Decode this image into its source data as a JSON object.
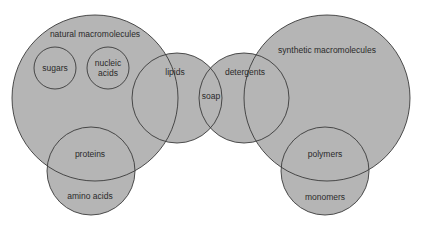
{
  "diagram": {
    "type": "venn",
    "colors": {
      "background": "#ffffff",
      "fill": "#b5b5b5",
      "stroke": "#3a3a3a",
      "text": "#2a2a2a"
    },
    "sets": {
      "natural_macromolecules": {
        "label": "natural macromolecules",
        "cx": 95,
        "cy": 98,
        "r": 83
      },
      "sugars": {
        "label": "sugars",
        "cx": 55,
        "cy": 68,
        "r": 21
      },
      "nucleic_acids": {
        "label_line1": "nucleic",
        "label_line2": "acids",
        "cx": 108,
        "cy": 68,
        "r": 21
      },
      "lipids": {
        "label": "lipids",
        "cx": 177,
        "cy": 98,
        "r": 45
      },
      "soap": {
        "label": "soap"
      },
      "detergents": {
        "label": "detergents",
        "cx": 244,
        "cy": 98,
        "r": 45
      },
      "synthetic_macromolecules": {
        "label": "synthetic macromolecules",
        "cx": 327,
        "cy": 98,
        "r": 83
      },
      "proteins_amino": {
        "upper_label": "proteins",
        "lower_label": "amino acids",
        "cx": 91,
        "cy": 171,
        "r": 44
      },
      "polymers_monomers": {
        "upper_label": "polymers",
        "lower_label": "monomers",
        "cx": 325,
        "cy": 171,
        "r": 44
      }
    }
  }
}
